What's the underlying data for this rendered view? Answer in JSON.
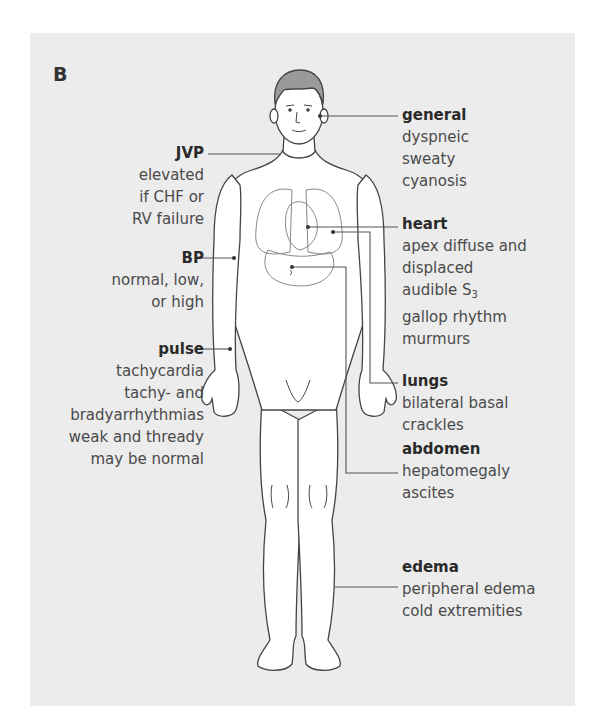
{
  "panel_letter": "B",
  "colors": {
    "panel_bg": "#ececec",
    "line": "#555555",
    "hair": "#9a9a9a",
    "text": "#4a4a4a",
    "heading": "#2a2a2a"
  },
  "labels": {
    "general": {
      "heading": "general",
      "lines": [
        "dyspneic",
        "sweaty",
        "cyanosis"
      ]
    },
    "jvp": {
      "heading": "JVP",
      "lines": [
        "elevated",
        "if CHF or",
        "RV failure"
      ]
    },
    "heart": {
      "heading": "heart",
      "lines": [
        "apex diffuse and",
        "displaced",
        "audible S",
        "gallop rhythm",
        "murmurs"
      ],
      "s3_sub": "3"
    },
    "bp": {
      "heading": "BP",
      "lines": [
        "normal, low,",
        "or high"
      ]
    },
    "pulse": {
      "heading": "pulse",
      "lines": [
        "tachycardia",
        "tachy- and",
        "bradyarrhythmias",
        "weak and thready",
        "may be normal"
      ]
    },
    "lungs": {
      "heading": "lungs",
      "lines": [
        "bilateral basal",
        "crackles"
      ]
    },
    "abdomen": {
      "heading": "abdomen",
      "lines": [
        "hepatomegaly",
        "ascites"
      ]
    },
    "edema": {
      "heading": "edema",
      "lines": [
        "peripheral edema",
        "cold extremities"
      ]
    }
  }
}
